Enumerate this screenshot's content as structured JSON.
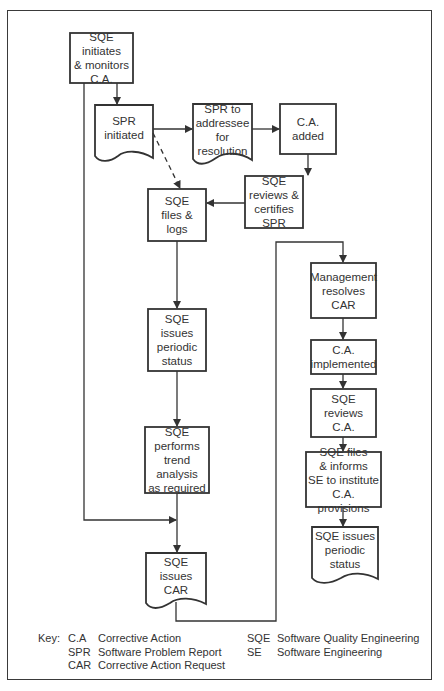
{
  "nodes": [
    {
      "id": "n1",
      "shape": "process",
      "text": "SQE\ninitiates\n& monitors\nC.A."
    },
    {
      "id": "n2",
      "shape": "document",
      "text": "SPR\ninitiated"
    },
    {
      "id": "n3",
      "shape": "document",
      "text": "SPR to\naddressee\nfor\nresolution"
    },
    {
      "id": "n4",
      "shape": "process",
      "text": "C.A.\nadded"
    },
    {
      "id": "n5",
      "shape": "process",
      "text": "SQE\nreviews &\ncertifies\nSPR"
    },
    {
      "id": "n6",
      "shape": "process",
      "text": "SQE\nfiles &\nlogs"
    },
    {
      "id": "n7",
      "shape": "process",
      "text": "SQE\nissues\nperiodic\nstatus"
    },
    {
      "id": "n8",
      "shape": "process",
      "text": "SQE\nperforms\ntrend\nanalysis\nas required"
    },
    {
      "id": "n9",
      "shape": "document",
      "text": "SQE\nissues\nCAR"
    },
    {
      "id": "n10",
      "shape": "process",
      "text": "Management\nresolves\nCAR"
    },
    {
      "id": "n11",
      "shape": "process",
      "text": "C.A.\nimplemented"
    },
    {
      "id": "n12",
      "shape": "process",
      "text": "SQE\nreviews\nC.A."
    },
    {
      "id": "n13",
      "shape": "process",
      "text": "SQE files\n& informs\nSE to institute\nC.A. provisions"
    },
    {
      "id": "n14",
      "shape": "document",
      "text": "SQE issues\nperiodic\nstatus"
    }
  ],
  "edges": [
    {
      "from": "n1",
      "to": "n2",
      "style": "solid"
    },
    {
      "from": "n2",
      "to": "n3",
      "style": "solid"
    },
    {
      "from": "n3",
      "to": "n4",
      "style": "solid"
    },
    {
      "from": "n4",
      "to": "n5",
      "style": "solid"
    },
    {
      "from": "n5",
      "to": "n6",
      "style": "solid"
    },
    {
      "from": "n2",
      "to": "n6",
      "style": "dashed"
    },
    {
      "from": "n6",
      "to": "n7",
      "style": "solid"
    },
    {
      "from": "n7",
      "to": "n8",
      "style": "solid"
    },
    {
      "from": "n8",
      "to": "n9",
      "style": "solid"
    },
    {
      "from": "n1",
      "to": "n9",
      "style": "solid"
    },
    {
      "from": "n9",
      "to": "n10",
      "style": "solid"
    },
    {
      "from": "n10",
      "to": "n11",
      "style": "solid"
    },
    {
      "from": "n11",
      "to": "n12",
      "style": "solid"
    },
    {
      "from": "n12",
      "to": "n13",
      "style": "solid"
    },
    {
      "from": "n13",
      "to": "n14",
      "style": "solid"
    }
  ],
  "key": {
    "label": "Key:",
    "entries": [
      {
        "abbr": "C.A",
        "meaning": "Corrective Action"
      },
      {
        "abbr": "SPR",
        "meaning": "Software Problem Report"
      },
      {
        "abbr": "CAR",
        "meaning": "Corrective Action Request"
      },
      {
        "abbr": "SQE",
        "meaning": "Software Quality Engineering"
      },
      {
        "abbr": "SE",
        "meaning": "Software Engineering"
      }
    ]
  },
  "colors": {
    "line": "#333333",
    "background": "#ffffff",
    "text": "#333333"
  }
}
